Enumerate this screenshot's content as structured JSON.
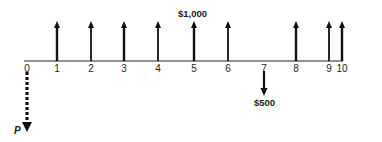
{
  "diagram": {
    "type": "cash-flow-timeline",
    "axis": {
      "x_start": 24,
      "x_end": 343,
      "y": 61,
      "color": "#222222"
    },
    "periods": [
      {
        "label": "0",
        "x": 27
      },
      {
        "label": "1",
        "x": 57
      },
      {
        "label": "2",
        "x": 91
      },
      {
        "label": "3",
        "x": 124
      },
      {
        "label": "4",
        "x": 158
      },
      {
        "label": "5",
        "x": 194
      },
      {
        "label": "6",
        "x": 228
      },
      {
        "label": "7",
        "x": 264
      },
      {
        "label": "8",
        "x": 296
      },
      {
        "label": "9",
        "x": 329
      },
      {
        "label": "10",
        "x": 342
      }
    ],
    "inflows": {
      "amount_label": "$1,000",
      "periods": [
        1,
        2,
        3,
        4,
        5,
        6,
        8,
        9,
        10
      ],
      "x": [
        57,
        91,
        124,
        158,
        194,
        228,
        296,
        329,
        342
      ]
    },
    "outflow": {
      "amount_label": "$500",
      "period": 7,
      "x": 264
    },
    "present_value": {
      "label": "P",
      "period": 0,
      "x": 27,
      "style": "dashed"
    }
  }
}
